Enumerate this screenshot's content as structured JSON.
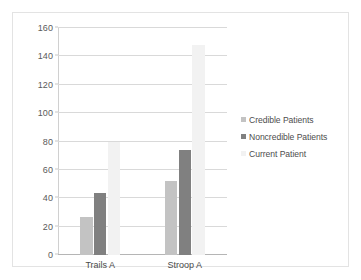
{
  "chart_data": {
    "type": "bar",
    "title": "",
    "xlabel": "",
    "ylabel": "",
    "categories": [
      "Trails A",
      "Stroop A"
    ],
    "series": [
      {
        "name": "Credible Patients",
        "color": "#c3c3c3",
        "values": [
          27,
          52
        ]
      },
      {
        "name": "Noncredible Patients",
        "color": "#808080",
        "values": [
          44,
          74
        ]
      },
      {
        "name": "Current Patient",
        "color": "#f2f2f2",
        "values": [
          80,
          148
        ]
      }
    ],
    "ylim": [
      0,
      160
    ],
    "yticks": [
      0,
      20,
      40,
      60,
      80,
      100,
      120,
      140,
      160
    ],
    "ytick_labels": [
      "0",
      "20",
      "40",
      "60",
      "80",
      "100",
      "120",
      "140",
      "160"
    ],
    "grid": true,
    "legend_position": "right"
  },
  "legend": {
    "items": [
      {
        "label": "Credible Patients"
      },
      {
        "label": "Noncredible Patients"
      },
      {
        "label": "Current Patient"
      }
    ]
  }
}
